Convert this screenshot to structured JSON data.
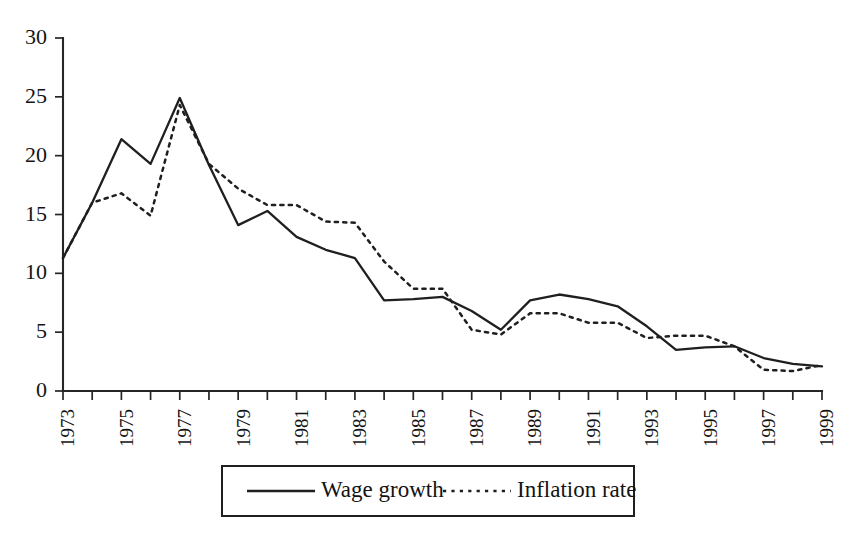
{
  "chart_data": {
    "type": "line",
    "title": "",
    "subtitle": "",
    "xlabel": "",
    "ylabel": "",
    "xlim": [
      1973,
      1999
    ],
    "ylim": [
      0,
      30
    ],
    "grid": false,
    "legend_position": "bottom-center",
    "y_ticks": [
      0,
      5,
      10,
      15,
      20,
      25,
      30
    ],
    "y_tick_labels": [
      "0",
      "5",
      "10",
      "15",
      "20",
      "25",
      "30"
    ],
    "x": [
      1973,
      1974,
      1975,
      1976,
      1977,
      1978,
      1979,
      1980,
      1981,
      1982,
      1983,
      1984,
      1985,
      1986,
      1987,
      1988,
      1989,
      1990,
      1991,
      1992,
      1993,
      1994,
      1995,
      1996,
      1997,
      1998,
      1999
    ],
    "x_tick_labels": [
      "1973",
      "1975",
      "1977",
      "1979",
      "1981",
      "1983",
      "1985",
      "1987",
      "1989",
      "1991",
      "1993",
      "1995",
      "1997",
      "1999"
    ],
    "x_tick_values": [
      1973,
      1975,
      1977,
      1979,
      1981,
      1983,
      1985,
      1987,
      1989,
      1991,
      1993,
      1995,
      1997,
      1999
    ],
    "series": [
      {
        "name": "Wage growth",
        "style": "solid",
        "color": "#1f1f1f",
        "values": [
          11.3,
          16.0,
          21.4,
          19.3,
          24.9,
          19.2,
          14.1,
          15.3,
          13.1,
          12.0,
          11.3,
          7.7,
          7.8,
          8.0,
          6.8,
          5.2,
          7.7,
          8.2,
          7.8,
          7.2,
          5.5,
          3.5,
          3.7,
          3.8,
          2.8,
          2.3,
          2.1
        ]
      },
      {
        "name": "Inflation rate",
        "style": "dotted",
        "color": "#1f1f1f",
        "values": [
          11.3,
          16.0,
          16.8,
          14.9,
          24.3,
          19.3,
          17.2,
          15.8,
          15.8,
          14.4,
          14.3,
          11.0,
          8.7,
          8.7,
          5.2,
          4.8,
          6.6,
          6.6,
          5.8,
          5.8,
          4.5,
          4.7,
          4.7,
          3.8,
          1.8,
          1.7,
          2.2
        ]
      }
    ]
  },
  "legend": {
    "items": [
      {
        "label": "Wage growth",
        "style": "solid"
      },
      {
        "label": "Inflation rate",
        "style": "dotted"
      }
    ]
  }
}
